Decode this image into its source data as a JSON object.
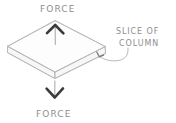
{
  "diagram": {
    "background_color": "#ffffff",
    "line_color": "#b9b9b9",
    "text_color": "#8d8d8d",
    "arrow_head_color": "#3a3a3a",
    "labels": {
      "force_top": "FORCE",
      "force_bottom": "FORCE",
      "callout_line1": "SLICE OF",
      "callout_line2": "COLUMN"
    },
    "elements": {
      "slab_name": "slice-of-column-slab",
      "arrow_up_name": "force-arrow-up",
      "arrow_down_name": "force-arrow-down",
      "axis_name": "center-axis-dashed-line",
      "leader_name": "callout-leader-line"
    }
  }
}
